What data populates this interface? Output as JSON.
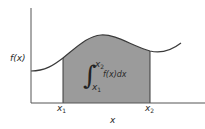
{
  "diagram": {
    "type": "definite-integral-area-under-curve",
    "y_axis_label": "f(x)",
    "x_axis_label": "x",
    "lower_bound_label": {
      "base": "x",
      "sub": "1"
    },
    "upper_bound_label": {
      "base": "x",
      "sub": "2"
    },
    "integral": {
      "upper": {
        "base": "x",
        "sub": "2"
      },
      "lower": {
        "base": "x",
        "sub": "1"
      },
      "integrand": "f(x)dx"
    },
    "colors": {
      "shaded_area": "#9b9b9b",
      "curve": "#3a3a3a",
      "axes": "#555555",
      "background": "#ffffff"
    }
  }
}
